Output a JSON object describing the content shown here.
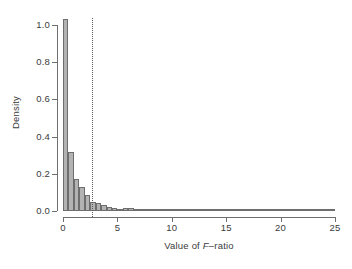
{
  "figure": {
    "background": "#ffffff",
    "bar_fill": "#b3b3b3",
    "bar_stroke": "#6e6e6e",
    "axis_color": "#6e6e6e",
    "text_color": "#3b3b3b",
    "threshold_color": "#5a5a5a"
  },
  "axes": {
    "x_title_prefix": "Value of ",
    "x_title_italic": "F",
    "x_title_suffix": "–ratio",
    "x_title_full": "Value of F–ratio",
    "y_title": "Density",
    "x_ticks": [
      0,
      5,
      10,
      15,
      20,
      25
    ],
    "x_tick_labels": [
      "0",
      "5",
      "10",
      "15",
      "20",
      "25"
    ],
    "y_ticks": [
      0.0,
      0.2,
      0.4,
      0.6,
      0.8,
      1.0
    ],
    "y_tick_labels": [
      "0.0",
      "0.2",
      "0.4",
      "0.6",
      "0.8",
      "1.0"
    ]
  },
  "annotations": {
    "threshold_value": 2.7,
    "threshold_style": "dotted"
  },
  "chart_data": {
    "type": "bar",
    "subtype": "histogram",
    "title": "",
    "xlabel": "Value of F–ratio",
    "ylabel": "Density",
    "xlim": [
      0,
      25
    ],
    "ylim": [
      0.0,
      1.04
    ],
    "grid": false,
    "legend": null,
    "bin_width": 0.5,
    "bin_starts": [
      0.0,
      0.5,
      1.0,
      1.5,
      2.0,
      2.5,
      3.0,
      3.5,
      4.0,
      4.5,
      5.0,
      5.5,
      6.0,
      6.5,
      7.0,
      7.5,
      8.0,
      8.5,
      9.0,
      9.5,
      10.0,
      10.5,
      11.0,
      11.5,
      12.0,
      12.5,
      13.0,
      13.5,
      14.0,
      14.5,
      15.0,
      15.5,
      16.0,
      16.5,
      17.0,
      17.5,
      18.0,
      18.5,
      19.0,
      19.5,
      20.0,
      20.5,
      21.0,
      21.5,
      22.0,
      22.5,
      23.0,
      23.5,
      24.0,
      24.5
    ],
    "categories": [
      "0.0",
      "0.5",
      "1.0",
      "1.5",
      "2.0",
      "2.5",
      "3.0",
      "3.5",
      "4.0",
      "4.5",
      "5.0",
      "5.5",
      "6.0",
      "6.5",
      "7.0",
      "7.5",
      "8.0",
      "8.5",
      "9.0",
      "9.5",
      "10.0",
      "10.5",
      "11.0",
      "11.5",
      "12.0",
      "12.5",
      "13.0",
      "13.5",
      "14.0",
      "14.5",
      "15.0",
      "15.5",
      "16.0",
      "16.5",
      "17.0",
      "17.5",
      "18.0",
      "18.5",
      "19.0",
      "19.5",
      "20.0",
      "20.5",
      "21.0",
      "21.5",
      "22.0",
      "22.5",
      "23.0",
      "23.5",
      "24.0",
      "24.5"
    ],
    "values": [
      1.03,
      0.318,
      0.173,
      0.127,
      0.088,
      0.05,
      0.042,
      0.03,
      0.024,
      0.018,
      0.013,
      0.016,
      0.014,
      0.008,
      0.007,
      0.006,
      0.005,
      0.005,
      0.004,
      0.004,
      0.003,
      0.003,
      0.003,
      0.003,
      0.002,
      0.002,
      0.002,
      0.002,
      0.002,
      0.002,
      0.002,
      0.001,
      0.001,
      0.001,
      0.001,
      0.001,
      0.001,
      0.001,
      0.001,
      0.001,
      0.001,
      0.001,
      0.001,
      0.001,
      0.001,
      0.001,
      0.001,
      0.001,
      0.001,
      0.001
    ],
    "annotations": [
      {
        "type": "vline",
        "x": 2.7,
        "style": "dotted",
        "label": ""
      }
    ]
  }
}
